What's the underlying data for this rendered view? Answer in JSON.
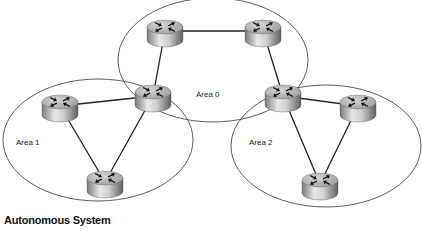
{
  "diagram": {
    "caption": "Autonomous System",
    "areas": [
      {
        "id": "area0",
        "label": "Area 0",
        "cx": 213,
        "cy": 60,
        "rx": 95,
        "ry": 62,
        "label_x": 196,
        "label_y": 97
      },
      {
        "id": "area1",
        "label": "Area 1",
        "cx": 98,
        "cy": 140,
        "rx": 95,
        "ry": 61,
        "label_x": 16,
        "label_y": 145
      },
      {
        "id": "area2",
        "label": "Area 2",
        "cx": 326,
        "cy": 146,
        "rx": 95,
        "ry": 61,
        "label_x": 249,
        "label_y": 145
      }
    ],
    "routers": [
      {
        "id": "r-area0-left",
        "x": 165,
        "y": 27
      },
      {
        "id": "r-area0-right",
        "x": 263,
        "y": 27
      },
      {
        "id": "r-abr-left",
        "x": 153,
        "y": 92
      },
      {
        "id": "r-abr-right",
        "x": 283,
        "y": 92
      },
      {
        "id": "r-area1-left",
        "x": 60,
        "y": 102
      },
      {
        "id": "r-area1-bottom",
        "x": 105,
        "y": 178
      },
      {
        "id": "r-area2-right",
        "x": 358,
        "y": 102
      },
      {
        "id": "r-area2-bottom",
        "x": 320,
        "y": 180
      }
    ],
    "links": [
      [
        "r-area0-left",
        "r-area0-right"
      ],
      [
        "r-area0-left",
        "r-abr-left"
      ],
      [
        "r-area0-right",
        "r-abr-right"
      ],
      [
        "r-abr-left",
        "r-area1-left"
      ],
      [
        "r-abr-left",
        "r-area1-bottom"
      ],
      [
        "r-area1-left",
        "r-area1-bottom"
      ],
      [
        "r-abr-right",
        "r-area2-right"
      ],
      [
        "r-abr-right",
        "r-area2-bottom"
      ],
      [
        "r-area2-right",
        "r-area2-bottom"
      ]
    ],
    "colors": {
      "ellipse_stroke": "#333333",
      "link_stroke": "#222222",
      "router_top": "#b8b8b8",
      "router_body_light": "#e6e6e6",
      "router_body_dark": "#6e6e6e",
      "arrow": "#111111"
    }
  }
}
